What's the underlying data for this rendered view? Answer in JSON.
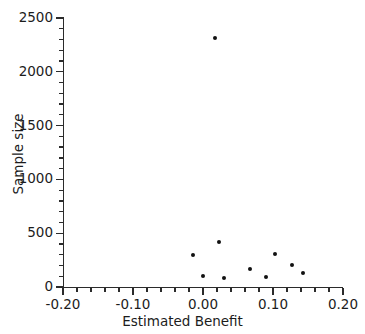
{
  "chart_data": {
    "type": "scatter",
    "title": "",
    "xlabel": "Estimated Benefit",
    "ylabel": "Sample size",
    "xlim": [
      -0.2,
      0.2
    ],
    "ylim": [
      0,
      2500
    ],
    "xticks": [
      -0.2,
      -0.1,
      0.0,
      0.1,
      0.2
    ],
    "xtick_labels": [
      "-0.20",
      "-0.10",
      "0.00",
      "0.10",
      "0.20"
    ],
    "yticks": [
      0,
      500,
      1000,
      1500,
      2000,
      2500
    ],
    "ytick_labels": [
      "0",
      "500",
      "1000",
      "1500",
      "2000",
      "2500"
    ],
    "x_minor_tick_interval": 0.02,
    "y_minor_tick_interval": 100,
    "grid": false,
    "legend": null,
    "marker": "filled-circle",
    "marker_color": "#111111",
    "points": [
      {
        "x": 0.017,
        "y": 2314
      },
      {
        "x": -0.014,
        "y": 297
      },
      {
        "x": 0.023,
        "y": 418
      },
      {
        "x": 0.0,
        "y": 102
      },
      {
        "x": 0.03,
        "y": 84
      },
      {
        "x": 0.067,
        "y": 167
      },
      {
        "x": 0.09,
        "y": 93
      },
      {
        "x": 0.103,
        "y": 307
      },
      {
        "x": 0.127,
        "y": 204
      },
      {
        "x": 0.143,
        "y": 130
      }
    ]
  },
  "axes": {
    "x_title": "Estimated Benefit",
    "y_title": "Sample size"
  }
}
